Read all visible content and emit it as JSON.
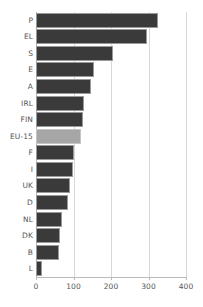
{
  "chart_data": {
    "type": "bar",
    "orientation": "horizontal",
    "title": "",
    "subtitle": "",
    "xlabel": "",
    "ylabel": "",
    "xlim": [
      0,
      400
    ],
    "ylim": null,
    "grid": true,
    "legend": null,
    "xticks": [
      0,
      100,
      200,
      300,
      400
    ],
    "xtick_labels": [
      "0",
      "100",
      "200",
      "300",
      "400"
    ],
    "categories": [
      "P",
      "EL",
      "S",
      "E",
      "A",
      "IRL",
      "FIN",
      "EU-15",
      "F",
      "I",
      "UK",
      "D",
      "NL",
      "DK",
      "B",
      "L"
    ],
    "values": [
      325,
      296,
      205,
      155,
      147,
      128,
      125,
      120,
      100,
      98,
      90,
      85,
      70,
      65,
      62,
      15
    ],
    "highlight_category": "EU-15",
    "colors": {
      "bar": "#3a3a3a",
      "bar_highlight": "#a6a6a6",
      "bar_border": "#9a9a9a",
      "bar_highlight_border": "#c4c4c4",
      "gridline": "#d8d8d8",
      "axis": "#b9b9b9",
      "text": "#555555",
      "background": "#ffffff"
    }
  }
}
